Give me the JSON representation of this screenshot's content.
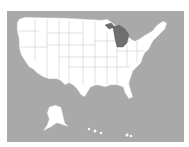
{
  "map": {
    "title": "United States map",
    "highlighted_state": "Michigan",
    "colors": {
      "water": "#a9a9a9",
      "land": "#ffffff",
      "highlight": "#6e6e6e",
      "border": "#9a9a9a"
    }
  }
}
